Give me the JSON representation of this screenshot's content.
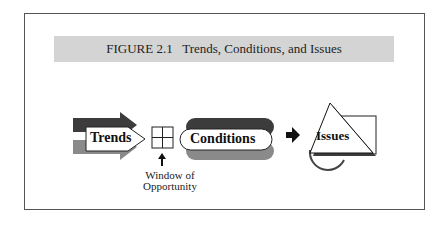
{
  "figure": {
    "number": "FIGURE 2.1",
    "title": "Trends, Conditions, and Issues"
  },
  "diagram": {
    "nodes": [
      {
        "id": "trends",
        "label": "Trends",
        "shape": "double-arrow"
      },
      {
        "id": "window",
        "label": "",
        "shape": "window-grid"
      },
      {
        "id": "conditions",
        "label": "Conditions",
        "shape": "double-pill"
      },
      {
        "id": "issues",
        "label": "Issues",
        "shape": "triangle-square-circle"
      }
    ],
    "annotation": {
      "line1": "Window of",
      "line2": "Opportunity"
    },
    "colors": {
      "dark": "#3c3c3c",
      "mid": "#8a8a8a",
      "band": "#d4d4d4"
    }
  }
}
